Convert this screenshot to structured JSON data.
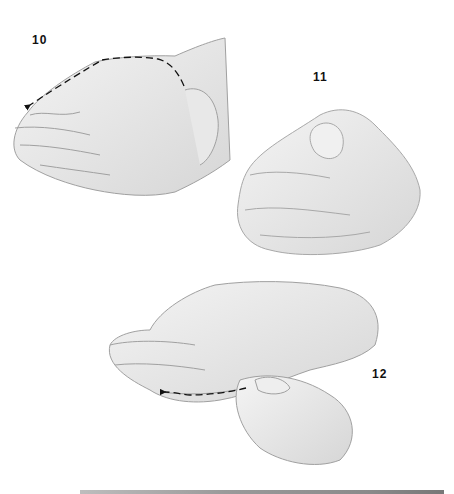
{
  "illustration": {
    "style": "pencil sketch",
    "colors": {
      "background": "#ffffff",
      "stroke": "#9a9a9a",
      "shade": "#d8d8d8",
      "arrow": "#111111",
      "label": "#111111",
      "bottom_bar": "#8a8a8a"
    },
    "steps": [
      {
        "number": "10",
        "description": "hand-with-thumb-stroke-arrows"
      },
      {
        "number": "11",
        "description": "hand-pinching-thumb"
      },
      {
        "number": "12",
        "description": "hand-with-finger-stroke-arrows"
      }
    ]
  }
}
